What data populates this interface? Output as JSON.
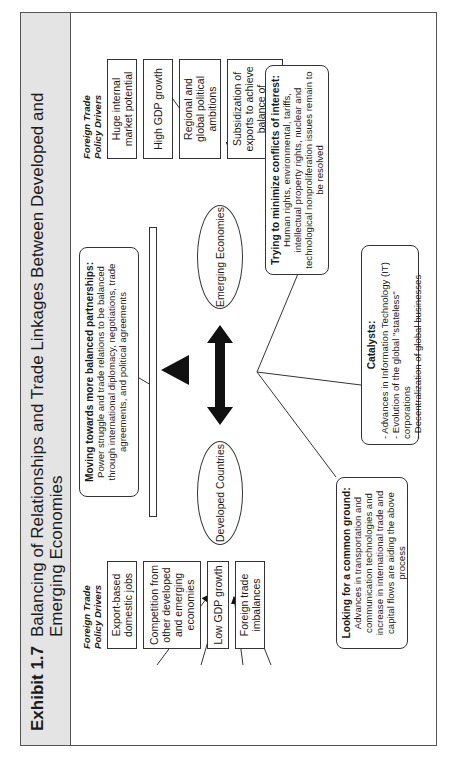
{
  "exhibit": {
    "label": "Exhibit 1.7",
    "title": "Balancing of Relationships and Trade Linkages Between Developed and Emerging Economies"
  },
  "developed": {
    "label": "Developed Countries",
    "drivers_heading": "Foreign Trade Policy Drivers",
    "drivers": [
      "Export-based domestic jobs",
      "Competition from other developed and emerging economies",
      "Low GDP growth",
      "Foreign trade imbalances"
    ]
  },
  "emerging": {
    "label": "Emerging Economies",
    "drivers_heading": "Foreign Trade Policy Drivers",
    "drivers": [
      "Huge internal market potential",
      "High GDP growth",
      "Regional and global political ambitions",
      "Subsidization of exports to achieve balance of payments"
    ]
  },
  "callouts": {
    "balanced": {
      "heading": "Moving towards more balanced partnerships:",
      "body": "Power struggle and trade relations to be balanced through international diplomacy, negotiations, trade agreements, and political agreements"
    },
    "common_ground": {
      "heading": "Looking for a common ground:",
      "body": "Advances in transportation and communication technologies and increase in international trade and capital flows are aiding the above process"
    },
    "conflicts": {
      "heading": "Trying to minimize conflicts of interest:",
      "body": "Human rights, environmental, tariffs, intellectual property rights, nuclear and technological nonproliferation issues remain to be resolved"
    },
    "catalysts": {
      "heading": "Catalysts:",
      "items": [
        "- Advances in Information Technology (IT)",
        "- Evolution of the global \"stateless\" corporations",
        "- Decentralization of global businesses"
      ]
    }
  },
  "colors": {
    "title_band": "#e4e4e4",
    "stroke": "#333333",
    "fill_solid": "#111111"
  }
}
